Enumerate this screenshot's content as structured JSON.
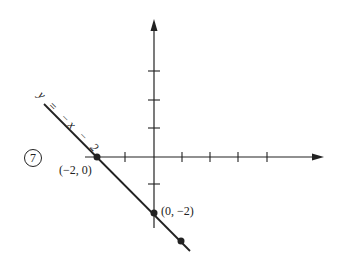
{
  "figure": {
    "problem_number": "7",
    "equation_label": "y = −x − 2",
    "points": [
      {
        "label": "(−2, 0)",
        "x": -2,
        "y": 0
      },
      {
        "label": "(0, −2)",
        "x": 0,
        "y": -2
      },
      {
        "label": "",
        "x": 1,
        "y": -3
      }
    ],
    "x_axis": {
      "ticks": [
        -2,
        -1,
        1,
        2,
        3,
        4
      ]
    },
    "y_axis": {
      "ticks": [
        3,
        2,
        1,
        -1,
        -2
      ]
    },
    "line_color": "#222222"
  }
}
